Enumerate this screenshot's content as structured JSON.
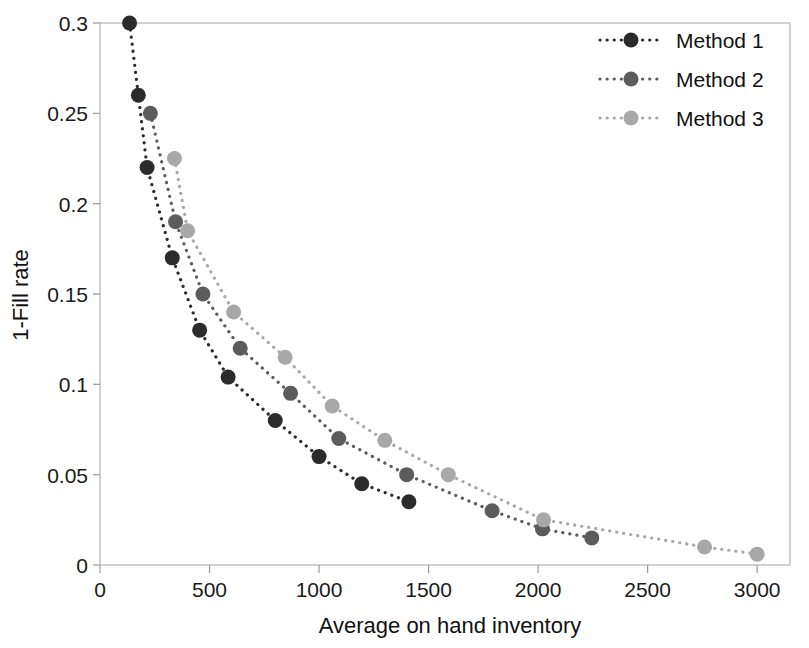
{
  "chart_data": {
    "type": "scatter",
    "title": "",
    "xlabel": "Average on hand inventory",
    "ylabel": "1-Fill rate",
    "xlim": [
      0,
      3150
    ],
    "ylim": [
      0,
      0.3
    ],
    "xticks": [
      "0",
      "500",
      "1000",
      "1500",
      "2000",
      "2500",
      "3000"
    ],
    "xtick_values": [
      0,
      500,
      1000,
      1500,
      2000,
      2500,
      3000
    ],
    "yticks": [
      "0",
      "0.05",
      "0.1",
      "0.15",
      "0.2",
      "0.25",
      "0.3"
    ],
    "ytick_values": [
      0,
      0.05,
      0.1,
      0.15,
      0.2,
      0.25,
      0.3
    ],
    "grid": false,
    "legend_position": "top-right",
    "marker": "circle",
    "linestyle": "dotted",
    "series": [
      {
        "name": "Method 1",
        "color": "#2b2b2b",
        "points": [
          [
            135,
            0.3
          ],
          [
            175,
            0.26
          ],
          [
            215,
            0.22
          ],
          [
            330,
            0.17
          ],
          [
            455,
            0.13
          ],
          [
            585,
            0.104
          ],
          [
            800,
            0.08
          ],
          [
            1000,
            0.06
          ],
          [
            1195,
            0.045
          ],
          [
            1410,
            0.035
          ]
        ]
      },
      {
        "name": "Method 2",
        "color": "#5c5c5c",
        "points": [
          [
            230,
            0.25
          ],
          [
            345,
            0.19
          ],
          [
            470,
            0.15
          ],
          [
            640,
            0.12
          ],
          [
            870,
            0.095
          ],
          [
            1090,
            0.07
          ],
          [
            1400,
            0.05
          ],
          [
            1790,
            0.03
          ],
          [
            2020,
            0.02
          ],
          [
            2245,
            0.015
          ]
        ]
      },
      {
        "name": "Method 3",
        "color": "#a8a8a8",
        "points": [
          [
            340,
            0.225
          ],
          [
            400,
            0.185
          ],
          [
            610,
            0.14
          ],
          [
            845,
            0.115
          ],
          [
            1060,
            0.088
          ],
          [
            1300,
            0.069
          ],
          [
            1590,
            0.05
          ],
          [
            2025,
            0.025
          ],
          [
            2760,
            0.01
          ],
          [
            3000,
            0.006
          ]
        ]
      }
    ],
    "legend": [
      {
        "label": "Method 1",
        "color": "#2b2b2b"
      },
      {
        "label": "Method 2",
        "color": "#5c5c5c"
      },
      {
        "label": "Method 3",
        "color": "#a8a8a8"
      }
    ]
  }
}
